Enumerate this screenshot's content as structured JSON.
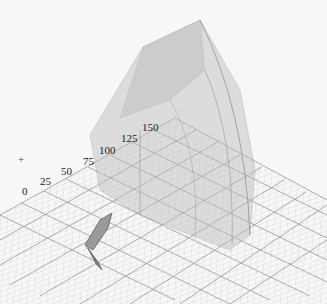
{
  "viewport": {
    "axis_ticks": [
      {
        "label": "0",
        "x": 22,
        "y": 186
      },
      {
        "label": "25",
        "x": 40,
        "y": 176
      },
      {
        "label": "50",
        "x": 61,
        "y": 166
      },
      {
        "label": "75",
        "x": 83,
        "y": 156
      },
      {
        "label": "100",
        "x": 99,
        "y": 145
      },
      {
        "label": "125",
        "x": 121,
        "y": 133
      },
      {
        "label": "150",
        "x": 142,
        "y": 122
      }
    ],
    "origin_marker": "+",
    "colors": {
      "background": "#f7f7f7",
      "grid": "#8a8a8a",
      "solid_fill": "#c8c8c8",
      "solid_edge": "#777777"
    }
  }
}
